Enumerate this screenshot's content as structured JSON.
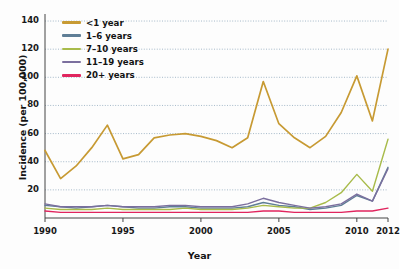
{
  "chart_data": {
    "type": "line",
    "title": "",
    "xlabel": "Year",
    "ylabel": "Incidence (per 100,000)",
    "xlim": [
      1990,
      2012
    ],
    "ylim": [
      0,
      145
    ],
    "yticks": [
      20,
      40,
      60,
      80,
      100,
      120,
      140
    ],
    "xticks": [
      1990,
      1995,
      2000,
      2005,
      2010,
      2012
    ],
    "grid": "horizontal-dotted",
    "legend_position": "top-left-inside",
    "x": [
      1990,
      1991,
      1992,
      1993,
      1994,
      1995,
      1996,
      1997,
      1998,
      1999,
      2000,
      2001,
      2002,
      2003,
      2004,
      2005,
      2006,
      2007,
      2008,
      2009,
      2010,
      2011,
      2012
    ],
    "series": [
      {
        "name": "<1 year",
        "color": "#c79a33",
        "values": [
          48,
          28,
          37,
          50,
          66,
          42,
          45,
          57,
          59,
          60,
          58,
          55,
          50,
          57,
          97,
          67,
          57,
          50,
          58,
          75,
          101,
          69,
          120
        ]
      },
      {
        "name": "1–6 years",
        "color": "#5f7e96",
        "values": [
          9,
          8,
          7,
          8,
          9,
          8,
          7,
          7,
          8,
          8,
          7,
          7,
          7,
          8,
          11,
          9,
          8,
          6,
          7,
          9,
          16,
          12,
          36
        ]
      },
      {
        "name": "7–10 years",
        "color": "#a8bb4a",
        "values": [
          7,
          6,
          6,
          6,
          7,
          6,
          6,
          6,
          6,
          7,
          6,
          6,
          6,
          7,
          9,
          8,
          7,
          7,
          11,
          18,
          31,
          19,
          56
        ]
      },
      {
        "name": "11–19 years",
        "color": "#7b6f9e",
        "values": [
          10,
          8,
          8,
          8,
          9,
          8,
          8,
          8,
          9,
          9,
          8,
          8,
          8,
          10,
          14,
          11,
          9,
          7,
          8,
          10,
          17,
          12,
          35
        ]
      },
      {
        "name": "20+ years",
        "color": "#e0255e",
        "values": [
          5,
          4,
          4,
          4,
          4,
          4,
          4,
          4,
          4,
          4,
          4,
          4,
          4,
          4,
          5,
          5,
          4,
          4,
          4,
          4,
          5,
          5,
          7
        ]
      }
    ]
  },
  "axes": {
    "y_tick_labels": [
      "140",
      "120",
      "100",
      "80",
      "60",
      "40",
      "20"
    ],
    "x_tick_labels": [
      "1990",
      "1995",
      "2000",
      "2005",
      "2010",
      "2012"
    ],
    "y_axis_title": "Incidence (per 100,000)",
    "x_axis_title": "Year"
  },
  "legend": {
    "items": [
      {
        "label": "<1 year",
        "color": "#c79a33"
      },
      {
        "label": "1–6 years",
        "color": "#5f7e96"
      },
      {
        "label": "7–10 years",
        "color": "#a8bb4a"
      },
      {
        "label": "11–19 years",
        "color": "#7b6f9e"
      },
      {
        "label": "20+ years",
        "color": "#e0255e"
      }
    ]
  },
  "style": {
    "grid_color": "#8fa8bd",
    "axis_color": "#444444",
    "background": "#fdfdfd"
  }
}
